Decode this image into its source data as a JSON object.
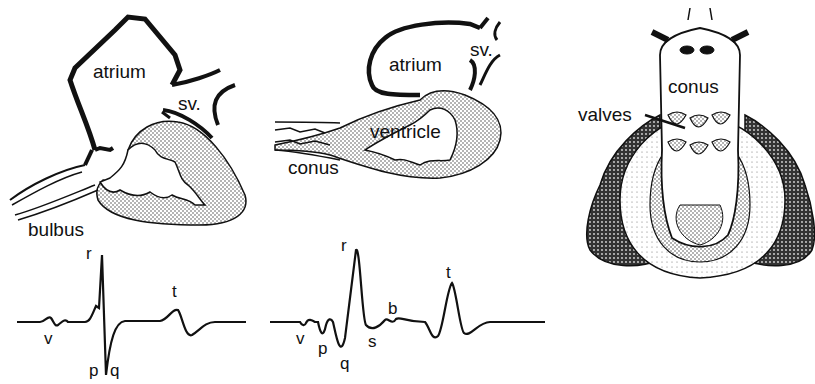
{
  "figure": {
    "panels": [
      {
        "id": "heart-left",
        "labels": {
          "atrium": "atrium",
          "sv": "sv.",
          "bulbus": "bulbus"
        }
      },
      {
        "id": "heart-middle",
        "labels": {
          "atrium": "atrium",
          "sv": "sv.",
          "ventricle": "ventricle",
          "conus": "conus"
        }
      },
      {
        "id": "heart-right",
        "labels": {
          "conus": "conus",
          "valves": "valves"
        }
      }
    ],
    "ecg_left": {
      "labels": {
        "r": "r",
        "t": "t",
        "v": "v",
        "p": "p",
        "q": "q"
      }
    },
    "ecg_middle": {
      "labels": {
        "r": "r",
        "t": "t",
        "b": "b",
        "v": "v",
        "p": "p",
        "q": "q",
        "s": "s"
      }
    },
    "colors": {
      "ink": "#111111",
      "background": "#ffffff",
      "stipple": "#bdbdbd",
      "dark_fill": "#444444"
    }
  }
}
